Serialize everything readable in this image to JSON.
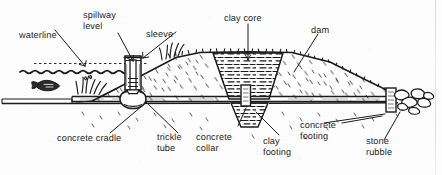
{
  "figure": {
    "ink_color": "#1b1b1b",
    "background_color": "#fdfdfd"
  },
  "labels": {
    "waterline": "waterline",
    "spillway_level": "spillway\nlevel",
    "sleeve": "sleeve",
    "clay_core": "clay core",
    "dam": "dam",
    "concrete_cradle": "concrete cradle",
    "trickle_tube": "trickle\ntube",
    "concrete_collar": "concrete\ncollar",
    "clay_footing": "clay\nfooting",
    "concrete_footing": "concrete\nfooting",
    "stone_rubble": "stone\nrubble"
  },
  "elements": {
    "water_body": "pond water at left behind dam",
    "fish": "fish silhouette in pond",
    "cattails": "marsh grass at shoreline",
    "standpipe": "vertical sleeve standpipe riser",
    "cradle": "rounded concrete cradle under riser base",
    "core": "trapezoidal clay core in dam centre",
    "tube": "horizontal trickle tube through embankment",
    "collar": "concrete collar on trickle tube",
    "footing_clay": "clay footing below core",
    "footing_concrete": "concrete footing at outlet",
    "rubble": "stone rubble at outlet discharge"
  }
}
